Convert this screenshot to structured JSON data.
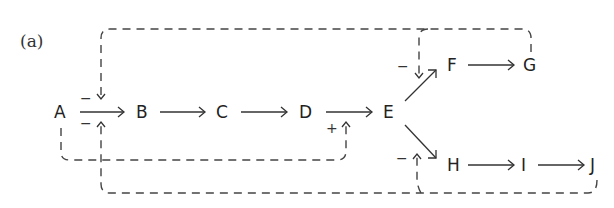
{
  "panel_label": "(a)",
  "nodes": {
    "A": "A",
    "B": "B",
    "C": "C",
    "D": "D",
    "E": "E",
    "F": "F",
    "G": "G",
    "H": "H",
    "I": "I",
    "J": "J"
  },
  "edges": [
    {
      "from": "A",
      "to": "B",
      "type": "activation"
    },
    {
      "from": "B",
      "to": "C",
      "type": "activation"
    },
    {
      "from": "C",
      "to": "D",
      "type": "activation"
    },
    {
      "from": "D",
      "to": "E",
      "type": "activation"
    },
    {
      "from": "E",
      "to": "F",
      "type": "activation"
    },
    {
      "from": "F",
      "to": "G",
      "type": "activation"
    },
    {
      "from": "E",
      "to": "H",
      "type": "activation"
    },
    {
      "from": "H",
      "to": "I",
      "type": "activation"
    },
    {
      "from": "I",
      "to": "J",
      "type": "activation"
    }
  ],
  "feedback": [
    {
      "from": "G",
      "to": "A->B",
      "sign": "−",
      "style": "dashed"
    },
    {
      "from": "G",
      "to": "E->F",
      "sign": "−",
      "style": "dashed"
    },
    {
      "from": "A",
      "to": "D->E",
      "sign": "+",
      "style": "dashed"
    },
    {
      "from": "J",
      "to": "A->B",
      "sign": "−",
      "style": "dashed"
    },
    {
      "from": "J",
      "to": "E->H",
      "sign": "−",
      "style": "dashed"
    }
  ],
  "signs": {
    "ab_top": "−",
    "ab_bottom": "−",
    "de_bottom": "+",
    "ef_left": "−",
    "eh_left": "−"
  }
}
